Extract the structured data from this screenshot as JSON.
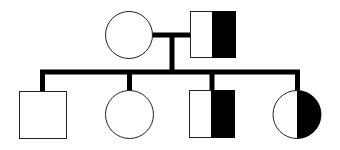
{
  "diagram": {
    "type": "pedigree",
    "colors": {
      "line": "#000000",
      "fill_affected": "#000000",
      "fill_unaffected": "#ffffff",
      "background": "#ffffff"
    },
    "generations": [
      {
        "label": "Parents",
        "members": [
          {
            "id": "mother",
            "sex": "female",
            "shape": "circle",
            "status": "unaffected"
          },
          {
            "id": "father",
            "sex": "male",
            "shape": "square",
            "status": "half-shaded (right half filled)"
          }
        ]
      },
      {
        "label": "Children",
        "members": [
          {
            "id": "child-1",
            "sex": "male",
            "shape": "square",
            "status": "unaffected"
          },
          {
            "id": "child-2",
            "sex": "female",
            "shape": "circle",
            "status": "unaffected"
          },
          {
            "id": "child-3",
            "sex": "male",
            "shape": "square",
            "status": "half-shaded (right half filled)"
          },
          {
            "id": "child-4",
            "sex": "female",
            "shape": "circle",
            "status": "half-shaded (right half filled)"
          }
        ]
      }
    ]
  }
}
